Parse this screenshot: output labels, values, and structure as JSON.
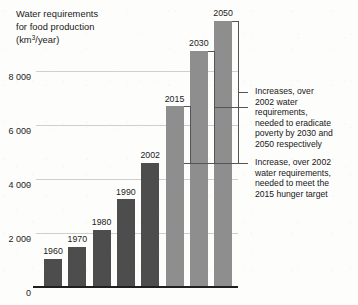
{
  "chart_data": {
    "type": "bar",
    "title_lines": [
      "Water requirements",
      "for food production",
      "(km",
      "/year)"
    ],
    "title_line1": "Water requirements",
    "title_line2": "for food production",
    "title_unit_prefix": "(km",
    "title_unit_sup": "3",
    "title_unit_suffix": "/year)",
    "xlabel": "",
    "ylabel": "km³/year",
    "ylim": [
      0,
      10400
    ],
    "grid": true,
    "legend_position": "none",
    "ytick_labels": [
      "0",
      "2 000",
      "4 000",
      "6 000",
      "8 000"
    ],
    "ytick_values": [
      0,
      2000,
      4000,
      6000,
      8000
    ],
    "categories": [
      "1960",
      "1970",
      "1980",
      "1990",
      "2002",
      "2015",
      "2030",
      "2050"
    ],
    "values": [
      1050,
      1500,
      2120,
      3250,
      4600,
      6700,
      8750,
      9850
    ],
    "series": [
      {
        "name": "Water requirements for food production",
        "categories": [
          "1960",
          "1970",
          "1980",
          "1990",
          "2002",
          "2015",
          "2030",
          "2050"
        ],
        "values": [
          1050,
          1500,
          2120,
          3250,
          4600,
          6700,
          8750,
          9850
        ],
        "kinds": [
          "historical",
          "historical",
          "historical",
          "historical",
          "historical",
          "projection",
          "projection",
          "projection"
        ]
      }
    ],
    "bars": [
      {
        "label": "1960",
        "value": 1050,
        "kind": "historical",
        "color": "#4d4d4d"
      },
      {
        "label": "1970",
        "value": 1500,
        "kind": "historical",
        "color": "#4d4d4d"
      },
      {
        "label": "1980",
        "value": 2120,
        "kind": "historical",
        "color": "#4d4d4d"
      },
      {
        "label": "1990",
        "value": 3250,
        "kind": "historical",
        "color": "#4d4d4d"
      },
      {
        "label": "2002",
        "value": 4600,
        "kind": "historical",
        "color": "#4d4d4d"
      },
      {
        "label": "2015",
        "value": 6700,
        "kind": "projection",
        "color": "#8e8e8e"
      },
      {
        "label": "2030",
        "value": 8750,
        "kind": "projection",
        "color": "#8e8e8e"
      },
      {
        "label": "2050",
        "value": 9850,
        "kind": "projection",
        "color": "#8e8e8e"
      }
    ],
    "annotations": [
      {
        "id": "increases-2030-2050",
        "text": "Increases, over\n2002 water\nrequirements,\nneeded to eradicate\npoverty by 2030 and\n2050 respectively",
        "refers_to": [
          "2030",
          "2050"
        ],
        "baseline_value": 4600
      },
      {
        "id": "increase-2015",
        "text": "Increase, over 2002\nwater requirements,\nneeded to meet the\n2015 hunger target",
        "refers_to": [
          "2015"
        ],
        "baseline_value": 4600
      }
    ],
    "colors": {
      "historical_bar": "#4d4d4d",
      "projection_bar": "#8e8e8e",
      "gridline": "#cfcfcf",
      "axis": "#1f1f1f",
      "bracket": "#555555",
      "text": "#1b1b1b",
      "background": "#fdfdfc"
    }
  }
}
